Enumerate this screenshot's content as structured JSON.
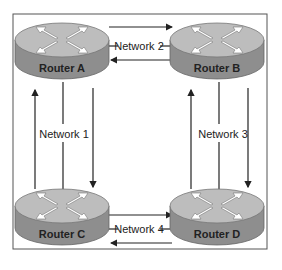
{
  "diagram": {
    "routers": [
      {
        "id": "A",
        "label": "Router A",
        "cx": 62,
        "cy": 40
      },
      {
        "id": "B",
        "label": "Router B",
        "cx": 217,
        "cy": 40
      },
      {
        "id": "C",
        "label": "Router C",
        "cx": 62,
        "cy": 213
      },
      {
        "id": "D",
        "label": "Router D",
        "cx": 217,
        "cy": 213
      }
    ],
    "networks": [
      {
        "label": "Network 1",
        "between": [
          "Router A",
          "Router C"
        ]
      },
      {
        "label": "Network 2",
        "between": [
          "Router A",
          "Router B"
        ]
      },
      {
        "label": "Network 3",
        "between": [
          "Router B",
          "Router D"
        ]
      },
      {
        "label": "Network 4",
        "between": [
          "Router C",
          "Router D"
        ]
      }
    ],
    "colors": {
      "router_top": "#b8b8b8",
      "router_side": "#8c8c8c",
      "arrow_fill": "#ffffff",
      "line": "#222222",
      "frame": "#444444"
    }
  }
}
